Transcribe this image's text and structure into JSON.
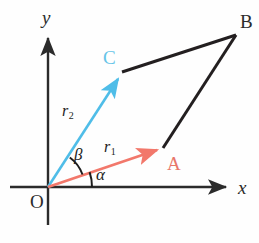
{
  "figure": {
    "background_color": "#fefefe",
    "width": 259,
    "height": 243
  },
  "colors": {
    "axis": "#2b2b2b",
    "black_line": "#231f20",
    "vector_r1": "#f2786b",
    "vector_r2": "#4fbde8",
    "label_a": "#e8766a",
    "label_c": "#66c4e8",
    "text": "#1d1d1d"
  },
  "axes": {
    "x_label": "x",
    "y_label": "y",
    "origin_label": "O",
    "origin": {
      "x": 48,
      "y": 187
    },
    "x_axis": {
      "from_x": 10,
      "to_x": 232,
      "y": 187
    },
    "y_axis": {
      "x": 48,
      "from_y": 225,
      "to_y": 32
    }
  },
  "vectors": [
    {
      "name": "r1",
      "label": "r",
      "subscript": "1",
      "endpoint_label": "A",
      "color": "#f2786b",
      "from": {
        "x": 48,
        "y": 187
      },
      "to": {
        "x": 163,
        "y": 148
      },
      "angle_label": "α",
      "angle_from_axis_deg": 19
    },
    {
      "name": "r2",
      "label": "r",
      "subscript": "2",
      "endpoint_label": "C",
      "color": "#4fbde8",
      "from": {
        "x": 48,
        "y": 187
      },
      "to": {
        "x": 122,
        "y": 72
      },
      "angle_label": "β",
      "angle_from_axis_deg": 57
    }
  ],
  "points": {
    "A": {
      "label": "A",
      "x": 163,
      "y": 148,
      "label_x": 167,
      "label_y": 154
    },
    "B": {
      "label": "B",
      "x": 236,
      "y": 35,
      "label_x": 240,
      "label_y": 12
    },
    "C": {
      "label": "C",
      "x": 122,
      "y": 72,
      "label_x": 103,
      "label_y": 48
    },
    "O": {
      "label": "O",
      "x": 48,
      "y": 187,
      "label_x": 30,
      "label_y": 192
    }
  },
  "parallelogram_sides": [
    {
      "name": "side-C-to-B",
      "from": "C",
      "to": "B",
      "color": "#231f20"
    },
    {
      "name": "side-A-to-B",
      "from": "A",
      "to": "B",
      "color": "#231f20"
    }
  ],
  "angle_arcs": [
    {
      "name": "alpha-arc",
      "label": "α",
      "label_x": 96,
      "label_y": 166,
      "radius": 44
    },
    {
      "name": "beta-arc",
      "label": "β",
      "label_x": 74,
      "label_y": 146,
      "radius": 36
    }
  ],
  "r_labels": [
    {
      "name": "r1-label",
      "text": "r",
      "sub": "1",
      "x": 104,
      "y": 139
    },
    {
      "name": "r2-label",
      "text": "r",
      "sub": "2",
      "x": 62,
      "y": 103
    }
  ]
}
